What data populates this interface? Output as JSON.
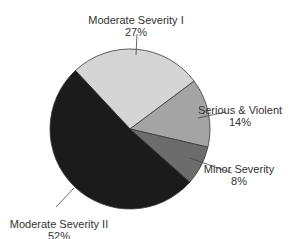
{
  "chart_data": {
    "type": "pie",
    "title": "",
    "start_angle_deg": -133,
    "center": [
      130,
      129
    ],
    "radius": 80,
    "slices": [
      {
        "label": "Moderate Severity I",
        "value": 27,
        "display": "27%",
        "color": "#d5d5d5"
      },
      {
        "label": "Serious & Violent",
        "value": 14,
        "display": "14%",
        "color": "#a4a4a4"
      },
      {
        "label": "Minor Severity",
        "value": 8,
        "display": "8%",
        "color": "#6c6c6c"
      },
      {
        "label": "Moderate Severity II",
        "value": 52,
        "display": "52%",
        "color": "#1b1b1b"
      }
    ],
    "labels": [
      {
        "x": 136,
        "y": 14,
        "anchor": [
          136,
          55
        ],
        "tip": [
          137,
          34
        ],
        "align": "center"
      },
      {
        "x": 240,
        "y": 104,
        "anchor": [
          198,
          118
        ],
        "tip": [
          226,
          112
        ],
        "align": "center"
      },
      {
        "x": 239,
        "y": 163,
        "anchor": [
          190,
          158
        ],
        "tip": [
          232,
          173
        ],
        "align": "center"
      },
      {
        "x": 59,
        "y": 218,
        "anchor": [
          74,
          188
        ],
        "tip": [
          56,
          207
        ],
        "align": "center"
      }
    ]
  }
}
